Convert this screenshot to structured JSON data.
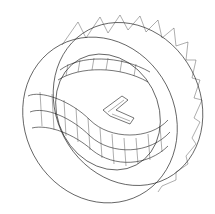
{
  "figure": {
    "type": "wireframe-3d-drawing",
    "background": "#ffffff",
    "stroke": "#1a1a1a",
    "components": [
      {
        "name": "outer-ring",
        "style": "triangulated band"
      },
      {
        "name": "inner-curved-tube",
        "style": "quad mesh"
      },
      {
        "name": "inner-arrow",
        "style": "wireframe chevron"
      }
    ]
  }
}
